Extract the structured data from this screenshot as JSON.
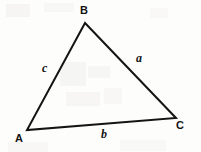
{
  "figure": {
    "kind": "geometry-diagram",
    "shape": "triangle",
    "background_color": "#fdfdfc",
    "stroke_color": "#141414",
    "stroke_width": 2
  },
  "vertices": [
    {
      "label": "B",
      "x": 85,
      "y": 23,
      "label_x": 80,
      "label_y": 5
    },
    {
      "label": "A",
      "x": 27,
      "y": 130,
      "label_x": 15,
      "label_y": 133
    },
    {
      "label": "C",
      "x": 176,
      "y": 118,
      "label_x": 176,
      "label_y": 120
    }
  ],
  "sides": [
    {
      "label": "a",
      "from": "B",
      "to": "C",
      "label_x": 136,
      "label_y": 52
    },
    {
      "label": "b",
      "from": "A",
      "to": "C",
      "label_x": 101,
      "label_y": 128
    },
    {
      "label": "c",
      "from": "A",
      "to": "B",
      "label_x": 42,
      "label_y": 62
    }
  ]
}
